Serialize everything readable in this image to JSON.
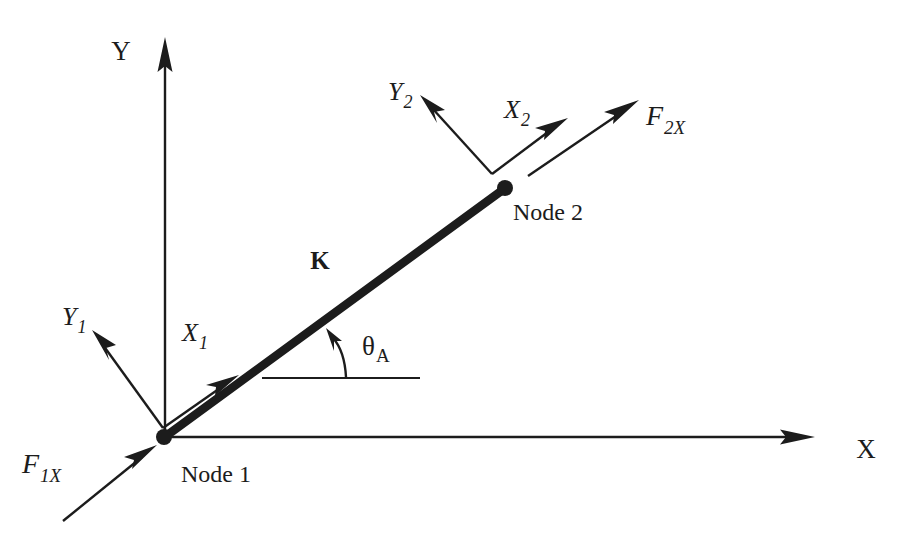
{
  "figure": {
    "background_color": "#ffffff",
    "ink_color": "#1c1c1c"
  },
  "global_axes": {
    "y_label": "Y",
    "x_label": "X",
    "origin_label": "Node 1"
  },
  "nodes": [
    {
      "id": "node1",
      "label": "Node 1",
      "x": 163,
      "y": 437
    },
    {
      "id": "node2",
      "label": "Node 2",
      "x": 505,
      "y": 188
    }
  ],
  "element": {
    "stiffness_label": "K",
    "from": "node1",
    "to": "node2"
  },
  "angle": {
    "symbol": "θ",
    "subscript": "A",
    "description": "Angle between global X direction and element axis"
  },
  "local_axes": [
    {
      "node": "node1",
      "x_axis": {
        "symbol": "X",
        "subscript": "1"
      },
      "y_axis": {
        "symbol": "Y",
        "subscript": "1"
      }
    },
    {
      "node": "node2",
      "x_axis": {
        "symbol": "X",
        "subscript": "2"
      },
      "y_axis": {
        "symbol": "Y",
        "subscript": "2"
      }
    }
  ],
  "forces": [
    {
      "id": "force-1x",
      "symbol": "F",
      "subscript": "1X",
      "at_node": "node1",
      "direction": "toward node 1, up and to the right"
    },
    {
      "id": "force-2x",
      "symbol": "F",
      "subscript": "2X",
      "at_node": "node2",
      "direction": "away from node 2, up and to the right"
    }
  ]
}
